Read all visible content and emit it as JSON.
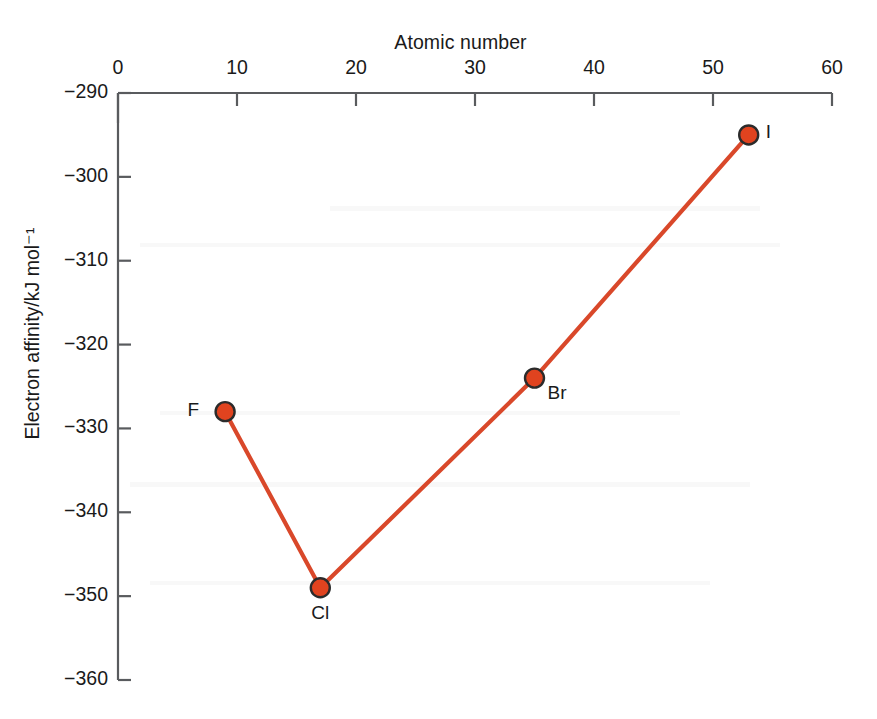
{
  "chart_data": {
    "type": "line",
    "title": "",
    "xlabel": "Atomic number",
    "ylabel": "Electron affinity/kJ mol⁻¹",
    "xlim": [
      0,
      60
    ],
    "ylim": [
      -360,
      -290
    ],
    "x_ticks": [
      0,
      10,
      20,
      30,
      40,
      50,
      60
    ],
    "x_tick_labels": [
      "0",
      "10",
      "20",
      "30",
      "40",
      "50",
      "60"
    ],
    "y_ticks": [
      -290,
      -300,
      -310,
      -320,
      -330,
      -340,
      -350,
      -360
    ],
    "y_tick_labels": [
      "−290",
      "−300",
      "−310",
      "−320",
      "−330",
      "−340",
      "−350",
      "−360"
    ],
    "x_axis_position": "top",
    "y_axis_position": "left",
    "grid": false,
    "legend": false,
    "series": [
      {
        "name": "Halogen electron affinity",
        "line_color": "#d9482a",
        "marker_color": "#e0431f",
        "marker_edge_color": "#2b2b2b",
        "points": [
          {
            "label": "F",
            "x": 9,
            "y": -328
          },
          {
            "label": "Cl",
            "x": 17,
            "y": -349
          },
          {
            "label": "Br",
            "x": 35,
            "y": -324
          },
          {
            "label": "I",
            "x": 53,
            "y": -295
          }
        ]
      }
    ],
    "annotations": [
      {
        "text": "F",
        "x": 9,
        "y": -328,
        "placement": "left"
      },
      {
        "text": "Cl",
        "x": 17,
        "y": -349,
        "placement": "below"
      },
      {
        "text": "Br",
        "x": 35,
        "y": -324,
        "placement": "below-right"
      },
      {
        "text": "I",
        "x": 53,
        "y": -295,
        "placement": "right"
      }
    ]
  },
  "axes": {
    "x_title": "Atomic number",
    "y_title": "Electron affinity/kJ mol⁻¹"
  },
  "ticks": {
    "x": [
      {
        "label": "0"
      },
      {
        "label": "10"
      },
      {
        "label": "20"
      },
      {
        "label": "30"
      },
      {
        "label": "40"
      },
      {
        "label": "50"
      },
      {
        "label": "60"
      }
    ],
    "y": [
      {
        "label": "−290"
      },
      {
        "label": "−300"
      },
      {
        "label": "−310"
      },
      {
        "label": "−320"
      },
      {
        "label": "−330"
      },
      {
        "label": "−340"
      },
      {
        "label": "−350"
      },
      {
        "label": "−360"
      }
    ]
  },
  "point_labels": [
    {
      "text": "F"
    },
    {
      "text": "Cl"
    },
    {
      "text": "Br"
    },
    {
      "text": "I"
    }
  ],
  "colors": {
    "line": "#d9482a",
    "marker_fill": "#e0431f",
    "marker_edge": "#2b2b2b",
    "axis": "#595b5e",
    "text": "#1a1a1a",
    "background": "#ffffff"
  }
}
